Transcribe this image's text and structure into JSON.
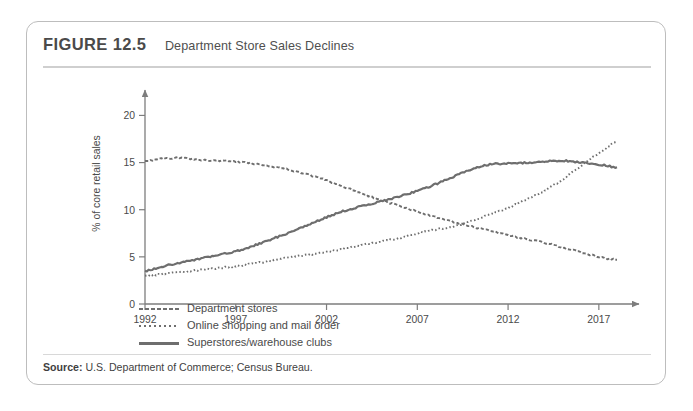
{
  "figure": {
    "number": "FIGURE 12.5",
    "title": "Department Store Sales Declines",
    "source_label": "Source:",
    "source_text": "U.S. Department of Commerce; Census Bureau."
  },
  "legend": {
    "items": [
      {
        "label": "Department stores",
        "style": "dashed",
        "color": "#6e6e6e"
      },
      {
        "label": "Online shopping and mail order",
        "style": "dotted",
        "color": "#6e6e6e"
      },
      {
        "label": "Superstores/warehouse clubs",
        "style": "solid",
        "color": "#6e6e6e"
      }
    ]
  },
  "chart_data": {
    "type": "line",
    "title": "Department Store Sales Declines",
    "xlabel": "",
    "ylabel": "% of core retail sales",
    "xlim": [
      1992,
      2018
    ],
    "ylim": [
      0,
      21
    ],
    "xticks": [
      "1992",
      "1997",
      "2002",
      "2007",
      "2012",
      "2017"
    ],
    "xtick_values": [
      1992,
      1997,
      2002,
      2007,
      2012,
      2017
    ],
    "yticks": [
      "0",
      "5",
      "10",
      "15",
      "20"
    ],
    "ytick_values": [
      0,
      5,
      10,
      15,
      20
    ],
    "grid": false,
    "legend_position": "below-left",
    "x": [
      1992,
      1993,
      1994,
      1995,
      1996,
      1997,
      1998,
      1999,
      2000,
      2001,
      2002,
      2003,
      2004,
      2005,
      2006,
      2007,
      2008,
      2009,
      2010,
      2011,
      2012,
      2013,
      2014,
      2015,
      2016,
      2017,
      2018
    ],
    "series": [
      {
        "name": "Department stores",
        "style": "dashed",
        "color": "#6e6e6e",
        "values": [
          15.2,
          15.4,
          15.5,
          15.3,
          15.2,
          15.1,
          14.9,
          14.6,
          14.2,
          13.7,
          13.1,
          12.4,
          11.7,
          11.0,
          10.4,
          9.8,
          9.2,
          8.7,
          8.2,
          7.8,
          7.3,
          6.9,
          6.5,
          6.0,
          5.5,
          5.0,
          4.7
        ]
      },
      {
        "name": "Online shopping and mail order",
        "style": "dotted",
        "color": "#6e6e6e",
        "values": [
          3.0,
          3.2,
          3.4,
          3.6,
          3.8,
          4.0,
          4.3,
          4.6,
          5.0,
          5.2,
          5.5,
          5.9,
          6.3,
          6.6,
          7.0,
          7.5,
          7.9,
          8.2,
          8.8,
          9.5,
          10.2,
          11.1,
          12.0,
          13.2,
          14.6,
          16.0,
          17.2
        ]
      },
      {
        "name": "Superstores/warehouse clubs",
        "style": "solid",
        "color": "#6e6e6e",
        "values": [
          3.5,
          4.0,
          4.4,
          4.8,
          5.2,
          5.6,
          6.2,
          6.9,
          7.6,
          8.4,
          9.2,
          9.9,
          10.4,
          10.9,
          11.4,
          12.0,
          12.7,
          13.5,
          14.3,
          14.8,
          14.9,
          15.0,
          15.1,
          15.2,
          15.0,
          14.8,
          14.5
        ]
      }
    ],
    "annotations": []
  }
}
